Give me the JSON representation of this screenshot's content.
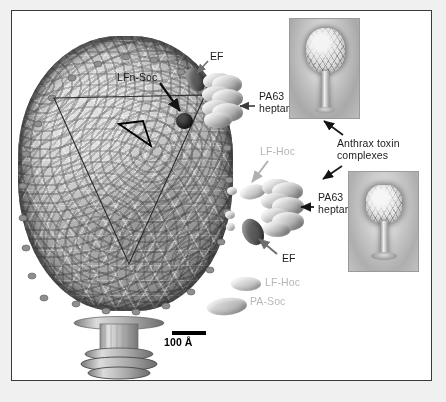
{
  "figure": {
    "kind": "cryo-em-reconstruction-diagram",
    "background_color": "#f0f0f0",
    "panel_background": "#ffffff",
    "frame_color": "#3a3a3a"
  },
  "scale_bar": {
    "label": "100 Å",
    "length_px": 34
  },
  "labels": {
    "lfn_soc": "LFn-Soc",
    "ef_top": "EF",
    "pa63_heptamer_top": "PA63\nheptamer",
    "lf_hoc_mid": "LF-Hoc",
    "pa63_heptamer_mid": "PA63\nheptamer",
    "ef_mid": "EF",
    "lf_hoc_low": "LF-Hoc",
    "pa_soc": "PA-Soc",
    "anthrax_toxin_complexes": "Anthrax toxin\ncomplexes"
  },
  "label_colors": {
    "dark_text": "#1c1c1c",
    "gray_text": "#b7b7b7",
    "scale_text": "#000000"
  },
  "components": [
    {
      "name": "LFn-Soc",
      "shape": "filled-circle",
      "color": "#000000"
    },
    {
      "name": "EF",
      "shape": "ellipse",
      "color": "#5d5d5d"
    },
    {
      "name": "LF-Hoc",
      "shape": "ellipse",
      "color": "#cfcfcf"
    },
    {
      "name": "PA-Soc",
      "shape": "ellipse",
      "color": "#c4c4c4"
    },
    {
      "name": "PA63 heptamer",
      "shape": "stacked-ellipse-barrel",
      "color": "#d2d2d2"
    }
  ],
  "insets": [
    {
      "id": "inset-top",
      "caption": "Anthrax toxin complexes",
      "content": "negative-stain electron micrograph of phage particle"
    },
    {
      "id": "inset-bottom",
      "caption": "Anthrax toxin complexes",
      "content": "negative-stain electron micrograph of phage particle"
    }
  ],
  "annotations": {
    "arrows": [
      {
        "name": "arrow-ef-top",
        "color": "#6e6e6e"
      },
      {
        "name": "arrow-lfn-soc",
        "color": "#000000"
      },
      {
        "name": "arrow-pa63-top",
        "color": "#3a3a3a"
      },
      {
        "name": "arrow-lf-hoc-mid",
        "color": "#b0b0b0"
      },
      {
        "name": "arrow-pa63-mid",
        "color": "#1c1c1c"
      },
      {
        "name": "arrow-ef-mid",
        "color": "#6e6e6e"
      },
      {
        "name": "arrow-inset-top",
        "color": "#1c1c1c"
      },
      {
        "name": "arrow-inset-bottom",
        "color": "#1c1c1c"
      }
    ],
    "facet_outline": "large triangular capsid facet with inner asymmetric-unit triangle"
  }
}
